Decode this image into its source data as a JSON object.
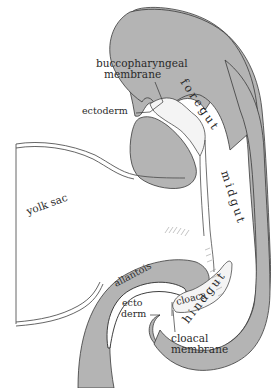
{
  "diagram": {
    "colors": {
      "tissue": "#b4b4b4",
      "outline": "#3a3a3a",
      "background": "#ffffff",
      "text": "#2a2a2a"
    },
    "labels": {
      "buccopharyngeal_line1": "buccopharyngeal",
      "buccopharyngeal_line2": "membrane",
      "ectoderm_top": "ectoderm",
      "foregut": "foregut",
      "yolk_sac": "yolk sac",
      "midgut": "midgut",
      "allantois": "allantois",
      "ectoderm_bottom_line1": "ecto",
      "ectoderm_bottom_line2": "derm",
      "cloaca": "cloaca",
      "hindgut": "hindgut",
      "cloacal_membrane_line1": "cloacal",
      "cloacal_membrane_line2": "membrane"
    }
  }
}
